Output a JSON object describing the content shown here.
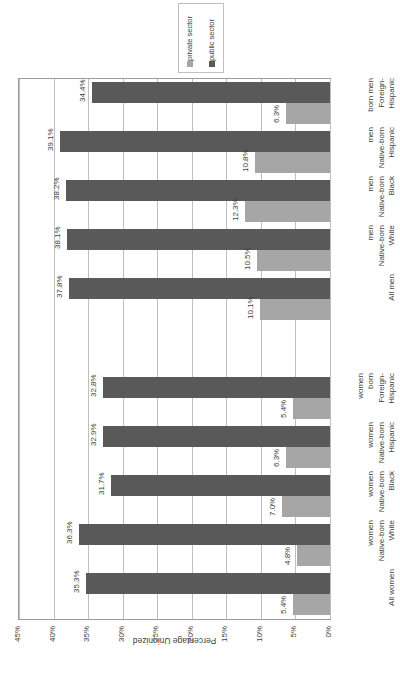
{
  "chart_data": {
    "type": "bar",
    "orientation": "horizontal",
    "title": "",
    "xlabel": "",
    "ylabel": "Percentage Unionized",
    "axis_title": "Percentage Unionized",
    "ylim": [
      0,
      45
    ],
    "tick_labels": [
      "45%",
      "40%",
      "35%",
      "30%",
      "25%",
      "20%",
      "15%",
      "10%",
      "5%",
      "0%"
    ],
    "tick_values": [
      45,
      40,
      35,
      30,
      25,
      20,
      15,
      10,
      5,
      0
    ],
    "grid": true,
    "legend_position": "top",
    "categories": [
      "Hispanic Foreign-born men",
      "Hispanic Native-born men",
      "Black Native-born men",
      "White Native-born men",
      "All men",
      "",
      "Hispanic Foreign-born women",
      "Hispanic Native-born women",
      "Black Native-born women",
      "White Native-born women",
      "All women"
    ],
    "category_lines": [
      [
        "Hispanic",
        "Foreign-",
        "born men"
      ],
      [
        "Hispanic",
        "Native-born",
        "men"
      ],
      [
        "Black",
        "Native-born",
        "men"
      ],
      [
        "White",
        "Native-born",
        "men"
      ],
      [
        "All men"
      ],
      [],
      [
        "Hispanic",
        "Foreign-",
        "born",
        "women"
      ],
      [
        "Hispanic",
        "Native-born",
        "women"
      ],
      [
        "Black",
        "Native-born",
        "women"
      ],
      [
        "White",
        "Native-born",
        "women"
      ],
      [
        "All women"
      ]
    ],
    "series": [
      {
        "name": "public sector",
        "color": "#595959",
        "values": [
          34.4,
          39.1,
          38.2,
          38.1,
          37.8,
          null,
          32.8,
          32.9,
          31.7,
          36.3,
          35.3
        ],
        "labels": [
          "34.4%",
          "39.1%",
          "38.2%",
          "38.1%",
          "37.8%",
          "",
          "32.8%",
          "32.9%",
          "31.7%",
          "36.3%",
          "35.3%"
        ]
      },
      {
        "name": "private sector",
        "color": "#a6a6a6",
        "values": [
          6.3,
          10.8,
          12.3,
          10.5,
          10.1,
          null,
          5.4,
          6.3,
          7.0,
          4.8,
          5.4
        ],
        "labels": [
          "6.3%",
          "10.8%",
          "12.3%",
          "10.5%",
          "10.1%",
          "",
          "5.4%",
          "6.3%",
          "7.0%",
          "4.8%",
          "5.4%"
        ]
      }
    ]
  },
  "legend": {
    "items": [
      {
        "label": "public sector",
        "color": "#595959",
        "marker": "square-dark"
      },
      {
        "label": "private sector",
        "color": "#a6a6a6",
        "marker": "square-light"
      }
    ]
  }
}
